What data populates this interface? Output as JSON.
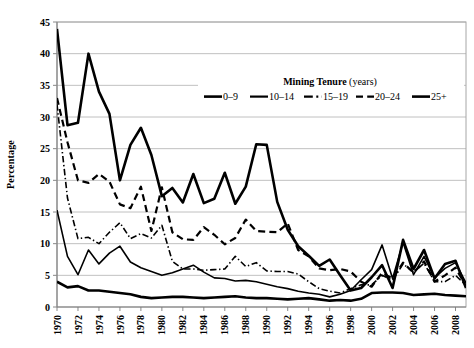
{
  "chart_data": {
    "type": "line",
    "title": "",
    "xlabel": "",
    "ylabel": "Percentage",
    "ylim": [
      0,
      45
    ],
    "ytick_step": 5,
    "yticks": [
      "0",
      "5",
      "10",
      "15",
      "20",
      "25",
      "30",
      "35",
      "40",
      "45"
    ],
    "grid": true,
    "legend_position": "top-right-inside",
    "legend_title": "Mining Tenure",
    "legend_title_suffix": "(years)",
    "x": [
      1970,
      1971,
      1972,
      1973,
      1974,
      1975,
      1976,
      1977,
      1978,
      1979,
      1980,
      1981,
      1982,
      1983,
      1984,
      1985,
      1986,
      1987,
      1988,
      1989,
      1990,
      1991,
      1992,
      1993,
      1994,
      1995,
      1996,
      1997,
      1998,
      1999,
      2000,
      2001,
      2002,
      2003,
      2004,
      2005,
      2006,
      2007,
      2008,
      2009
    ],
    "xticks": [
      "1970",
      "1972",
      "1974",
      "1976",
      "1978",
      "1980",
      "1982",
      "1984",
      "1986",
      "1988",
      "1990",
      "1992",
      "1994",
      "1996",
      "1998",
      "2000",
      "2002",
      "2004",
      "2006",
      "2008"
    ],
    "xtick_rotation": -90,
    "series": [
      {
        "name": "0–9",
        "style": "solid",
        "width": 2.6,
        "color": "#000000",
        "values": [
          4.0,
          3.1,
          3.3,
          2.6,
          2.6,
          2.4,
          2.2,
          2.0,
          1.6,
          1.4,
          1.5,
          1.6,
          1.6,
          1.5,
          1.4,
          1.5,
          1.6,
          1.7,
          1.5,
          1.4,
          1.4,
          1.3,
          1.2,
          1.3,
          1.4,
          1.2,
          1.0,
          1.1,
          1.0,
          1.3,
          2.2,
          2.3,
          2.3,
          2.2,
          1.9,
          2.0,
          2.1,
          1.9,
          1.8,
          1.7
        ]
      },
      {
        "name": "10–14",
        "style": "solid",
        "width": 1.6,
        "color": "#000000",
        "values": [
          15.3,
          8.0,
          5.1,
          9.0,
          6.8,
          8.5,
          9.6,
          7.1,
          6.2,
          5.6,
          5.0,
          5.4,
          6.0,
          6.6,
          5.5,
          4.6,
          4.5,
          4.1,
          4.2,
          4.0,
          3.6,
          3.2,
          2.9,
          2.5,
          2.2,
          2.0,
          1.6,
          2.0,
          2.6,
          4.3,
          5.9,
          9.8,
          4.5,
          10.2,
          5.1,
          8.0,
          4.6,
          6.1,
          7.0,
          3.8
        ]
      },
      {
        "name": "15–19",
        "style": "dashdot",
        "width": 1.6,
        "color": "#000000",
        "values": [
          32.0,
          17.2,
          10.8,
          11.0,
          10.0,
          11.8,
          13.3,
          10.8,
          11.6,
          10.9,
          12.9,
          7.2,
          6.0,
          6.0,
          5.8,
          5.9,
          6.0,
          8.0,
          6.4,
          7.0,
          5.7,
          5.6,
          5.6,
          5.2,
          4.0,
          2.9,
          2.5,
          2.2,
          2.9,
          3.5,
          3.5,
          5.0,
          4.2,
          6.8,
          5.5,
          6.9,
          4.0,
          4.0,
          5.0,
          3.4
        ]
      },
      {
        "name": "20–24",
        "style": "dashed",
        "width": 2.2,
        "color": "#000000",
        "values": [
          33.0,
          26.0,
          20.0,
          19.6,
          21.0,
          19.8,
          16.2,
          15.6,
          19.0,
          12.0,
          18.9,
          11.8,
          10.7,
          10.6,
          12.6,
          11.4,
          9.9,
          10.9,
          13.8,
          12.0,
          11.9,
          11.8,
          13.2,
          9.0,
          8.0,
          6.1,
          5.8,
          6.0,
          5.6,
          4.0,
          3.2,
          5.4,
          4.5,
          7.0,
          5.4,
          7.2,
          4.0,
          5.0,
          6.2,
          3.3
        ]
      },
      {
        "name": "25+",
        "style": "solid",
        "width": 2.6,
        "color": "#000000",
        "values": [
          43.9,
          28.7,
          29.1,
          40.0,
          34.0,
          30.5,
          20.0,
          25.6,
          28.3,
          24.0,
          17.5,
          18.8,
          16.5,
          21.0,
          16.4,
          17.1,
          21.2,
          16.3,
          19.0,
          25.7,
          25.6,
          16.6,
          12.2,
          9.6,
          8.1,
          6.5,
          7.5,
          5.0,
          2.6,
          3.0,
          4.7,
          6.6,
          3.0,
          10.6,
          6.0,
          9.0,
          4.5,
          6.8,
          7.3,
          3.0
        ]
      }
    ]
  }
}
